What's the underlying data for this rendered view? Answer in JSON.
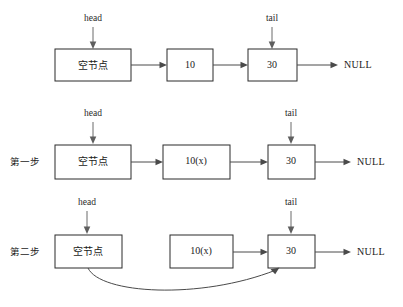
{
  "figure": {
    "background_color": "#ffffff",
    "box_stroke_color": "#2b2b2b",
    "line_color": "#4a4a4a",
    "null_terminator": "NULL"
  },
  "rows": [
    {
      "step_label": "",
      "pointers": [
        {
          "name": "head",
          "label": "head"
        },
        {
          "name": "tail",
          "label": "tail"
        }
      ],
      "nodes": [
        {
          "name": "empty-node",
          "label": "空节点"
        },
        {
          "name": "node-10",
          "label": "10"
        },
        {
          "name": "node-30",
          "label": "30"
        }
      ],
      "terminator": "NULL"
    },
    {
      "step_label": "第一步",
      "pointers": [
        {
          "name": "head",
          "label": "head"
        },
        {
          "name": "tail",
          "label": "tail"
        }
      ],
      "nodes": [
        {
          "name": "empty-node",
          "label": "空节点"
        },
        {
          "name": "node-10x",
          "label": "10(x)"
        },
        {
          "name": "node-30",
          "label": "30"
        }
      ],
      "terminator": "NULL"
    },
    {
      "step_label": "第二步",
      "pointers": [
        {
          "name": "head",
          "label": "head"
        },
        {
          "name": "tail",
          "label": "tail"
        }
      ],
      "nodes": [
        {
          "name": "empty-node",
          "label": "空节点"
        },
        {
          "name": "node-10x",
          "label": "10(x)"
        },
        {
          "name": "node-30",
          "label": "30"
        }
      ],
      "terminator": "NULL"
    }
  ]
}
